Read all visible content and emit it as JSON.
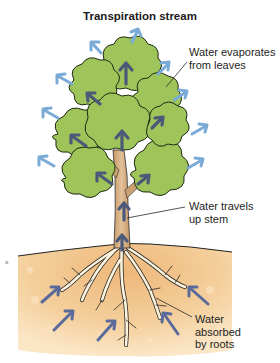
{
  "diagram": {
    "title": "Transpiration stream",
    "labels": {
      "evaporates": [
        "Water evaporates",
        "from leaves"
      ],
      "stem": [
        "Water travels",
        "up stem"
      ],
      "roots": [
        "Water",
        "absorbed",
        "by roots"
      ]
    },
    "colors": {
      "vapor_arrow": "#7aaad6",
      "water_arrow_dark": "#4a5a78",
      "soil_arrow": "#5a6a9a",
      "leaf_fill": "#9ec45a",
      "leaf_outline": "#1f2a14",
      "trunk": "#d4b088",
      "soil": "#f2c58e",
      "root_fill": "#fbf3dc"
    }
  }
}
